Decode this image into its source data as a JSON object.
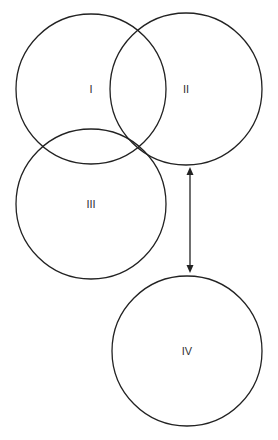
{
  "diagram": {
    "background": "#ffffff",
    "stroke_color": "#222222",
    "circles": [
      {
        "id": "I",
        "label": "I",
        "cx": 91,
        "cy": 89,
        "r": 75
      },
      {
        "id": "II",
        "label": "II",
        "cx": 186,
        "cy": 89,
        "r": 76
      },
      {
        "id": "III",
        "label": "III",
        "cx": 91,
        "cy": 204,
        "r": 75
      },
      {
        "id": "IV",
        "label": "IV",
        "cx": 187,
        "cy": 351,
        "r": 75
      }
    ],
    "arrow": {
      "type": "double-headed",
      "x": 190,
      "y1": 168,
      "y2": 272,
      "connects": [
        "II",
        "IV"
      ]
    }
  }
}
